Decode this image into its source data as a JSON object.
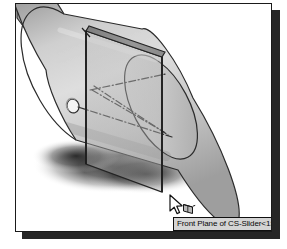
{
  "figure": {
    "kind": "cad-viewport-screenshot",
    "app_style": "SolidWorks 3D shaded view",
    "frame_border_color": "#1a1a1a",
    "frame_background": "#ffffff",
    "plate_shadow_color": "#262626"
  },
  "viewport": {
    "background": "#ffffff",
    "label": "3D graphics area"
  },
  "model": {
    "part_name": "CS-Slider<1>",
    "body": {
      "name": "slider-cylinder",
      "shading_light": "#e2e2e2",
      "shading_mid": "#c2c2c2",
      "shading_dark": "#8a8a8a",
      "edge_color": "#2b2b2b"
    },
    "arm": {
      "name": "connecting-arm-link",
      "shading_light": "#d8d8d8",
      "shading_dark": "#8d8d8d",
      "edge_color": "#2b2b2b"
    },
    "hole": {
      "name": "pin-hole",
      "fill": "#f2f2f2",
      "edge_color": "#2b2b2b"
    },
    "centerlines": {
      "name": "axis-centerlines",
      "style": "dash-dot",
      "color": "#3a3a3a"
    },
    "ground_shadow": {
      "name": "ground-shadow",
      "color": "#1e1e1e"
    }
  },
  "selection": {
    "plane_name": "Front Plane",
    "highlighted": true,
    "plane_face_fill": "#b4b4b4",
    "plane_top_fill": "#8f8f8f",
    "plane_edge_color": "#242424"
  },
  "cursor": {
    "name": "select-plane-cursor",
    "glyph": "arrow-pointer-with-plane-badge",
    "fill": "#ffffff",
    "outline": "#111111"
  },
  "tooltip": {
    "text": "Front Plane of CS-Slider<1>",
    "background": "#d4d4d4",
    "border_color": "#101010",
    "text_color": "#080808"
  }
}
